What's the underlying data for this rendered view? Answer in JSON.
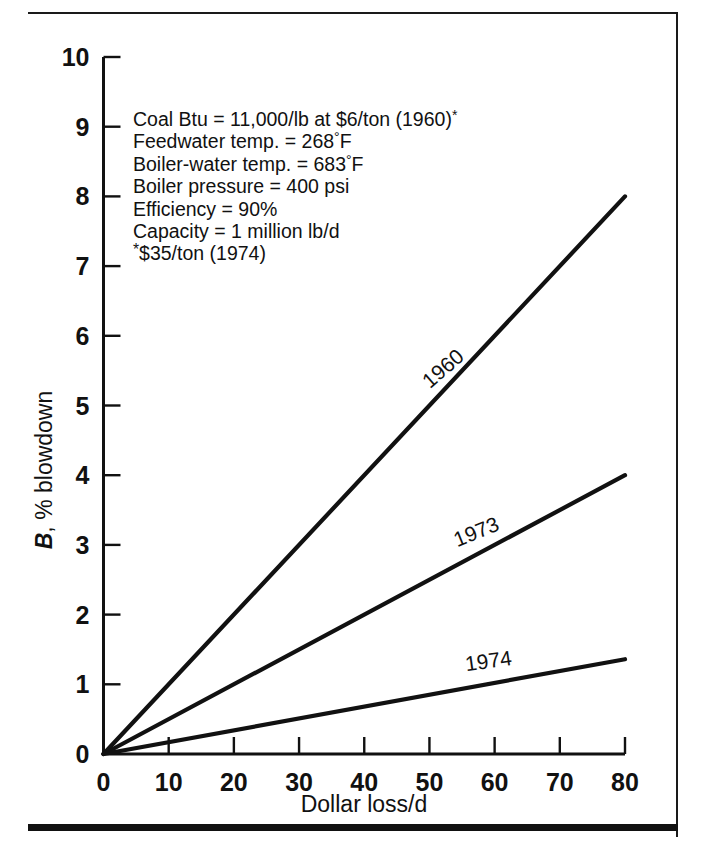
{
  "figure": {
    "background_color": "#ffffff",
    "ink_color": "#111111"
  },
  "annotation": {
    "lines": [
      "Coal Btu = 11,000/lb at $6/ton (1960)",
      "Feedwater temp. = 268",
      "Boiler-water temp. = 683",
      "Boiler pressure = 400 psi",
      "Efficiency = 90%",
      "Capacity = 1 million lb/d"
    ],
    "line1_suffix_marker": "*",
    "line2_unit": "F",
    "line3_unit": "F",
    "footnote": "$35/ton (1974)",
    "footnote_marker": "*"
  },
  "chart_data": {
    "type": "line",
    "title": "",
    "xlabel": "Dollar loss/d",
    "ylabel": "B, % blowdown",
    "ylabel_italic_prefix": "B",
    "ylabel_rest": ", % blowdown",
    "xlim": [
      0,
      80
    ],
    "ylim": [
      0,
      10
    ],
    "xticks": [
      0,
      10,
      20,
      30,
      40,
      50,
      60,
      70,
      80
    ],
    "xticklabels": [
      "0",
      "10",
      "20",
      "30",
      "40",
      "50",
      "60",
      "70",
      "80"
    ],
    "yticks": [
      0,
      1,
      2,
      3,
      4,
      5,
      6,
      7,
      8,
      9,
      10
    ],
    "yticklabels": [
      "0",
      "1",
      "2",
      "3",
      "4",
      "5",
      "6",
      "7",
      "8",
      "9",
      "10"
    ],
    "grid": false,
    "legend": "inline-labels",
    "series": [
      {
        "name": "1960",
        "label": "1960",
        "x": [
          0,
          80
        ],
        "values": [
          0,
          8.0
        ],
        "slope_per_dollar": 0.1,
        "label_angle_deg": -41
      },
      {
        "name": "1973",
        "label": "1973",
        "x": [
          0,
          80
        ],
        "values": [
          0,
          4.0
        ],
        "slope_per_dollar": 0.05,
        "label_angle_deg": -22
      },
      {
        "name": "1974",
        "label": "1974",
        "x": [
          0,
          80
        ],
        "values": [
          0,
          1.36
        ],
        "slope_per_dollar": 0.017,
        "label_angle_deg": -8
      }
    ]
  }
}
